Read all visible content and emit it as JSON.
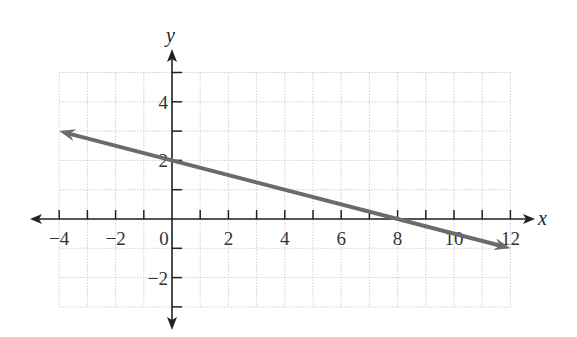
{
  "chart_data": {
    "type": "line",
    "title": "",
    "xlabel": "x",
    "ylabel": "y",
    "xlim": [
      -4,
      12
    ],
    "ylim": [
      -3,
      5
    ],
    "grid": true,
    "x_ticks": [
      -4,
      -2,
      0,
      2,
      4,
      6,
      8,
      10,
      12
    ],
    "x_tick_labels": [
      "−4",
      "−2",
      "0",
      "2",
      "4",
      "6",
      "8",
      "10",
      "12"
    ],
    "y_ticks": [
      4,
      2,
      -2
    ],
    "y_tick_labels": [
      "4",
      "2",
      "−2"
    ],
    "series": [
      {
        "name": "line",
        "equation": "y = -x/4 + 2",
        "x": [
          -4,
          0,
          8,
          12
        ],
        "y": [
          3,
          2,
          0,
          -1
        ],
        "color": "#6b6b6b",
        "arrows": "both"
      }
    ]
  }
}
